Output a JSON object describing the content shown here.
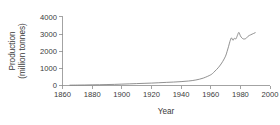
{
  "chart_data": {
    "type": "line",
    "title": "",
    "xlabel": "Year",
    "ylabel": "Production (million tonnes)",
    "ylabel_lines": [
      "Production",
      "(million tonnes)"
    ],
    "xlim": [
      1860,
      2000
    ],
    "ylim": [
      0,
      4000
    ],
    "xticks": [
      1860,
      1880,
      1900,
      1920,
      1940,
      1960,
      1980,
      2000
    ],
    "yticks": [
      0,
      1000,
      2000,
      3000,
      4000
    ],
    "xtick_labels": [
      "1860",
      "1880",
      "1900",
      "1920",
      "1940",
      "1960",
      "1980",
      "2000"
    ],
    "ytick_labels": [
      "0",
      "1000",
      "2000",
      "3000",
      "4000"
    ],
    "grid": false,
    "legend": null,
    "legend_position": "none",
    "line_color": "#7d7d7d",
    "series": [
      {
        "name": "Production",
        "x": [
          1865,
          1870,
          1875,
          1880,
          1885,
          1890,
          1895,
          1900,
          1905,
          1910,
          1915,
          1920,
          1925,
          1930,
          1935,
          1940,
          1945,
          1950,
          1955,
          1960,
          1962,
          1964,
          1966,
          1968,
          1970,
          1971,
          1972,
          1973,
          1974,
          1975,
          1976,
          1977,
          1978,
          1979,
          1980,
          1981,
          1982,
          1983,
          1984,
          1985,
          1986,
          1987,
          1988,
          1989,
          1990
        ],
        "values": [
          20,
          25,
          30,
          38,
          45,
          55,
          65,
          80,
          95,
          110,
          125,
          140,
          160,
          180,
          200,
          225,
          260,
          320,
          430,
          620,
          760,
          930,
          1130,
          1380,
          1700,
          1960,
          2250,
          2560,
          2760,
          2620,
          2740,
          2700,
          2900,
          3080,
          2880,
          2760,
          2700,
          2700,
          2740,
          2840,
          2900,
          2940,
          2980,
          3020,
          3060
        ]
      }
    ]
  },
  "axes": {
    "x_title": "Year",
    "y_title_line1": "Production",
    "y_title_line2": "(million tonnes)"
  }
}
